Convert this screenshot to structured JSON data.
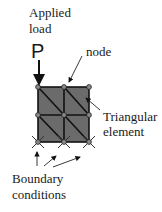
{
  "labels": {
    "applied_load_line1": "Applied",
    "applied_load_line2": "load",
    "load_symbol": "P",
    "node": "node",
    "triangular_line1": "Triangular",
    "triangular_line2": "element",
    "boundary_line1": "Boundary",
    "boundary_line2": "conditions"
  },
  "mesh": {
    "columns": 2,
    "rows": 2,
    "element_type": "triangular",
    "fill_color": "#6b6b6b",
    "line_color": "#111111",
    "node_color": "#8a8a8a"
  }
}
